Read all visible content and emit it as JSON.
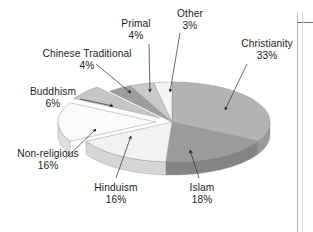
{
  "figure": {
    "name": "world-religions-pie-chart",
    "type": "exploded-3d-pie",
    "background_color": "#ffffff",
    "text_color": "#1c1c1c"
  },
  "chart_data": {
    "type": "pie",
    "title": "",
    "xlabel": "",
    "ylabel": "",
    "legend_position": "callout-labels",
    "grid": false,
    "units": "percent",
    "categories": [
      "Christianity",
      "Islam",
      "Hinduism",
      "Non-religious",
      "Buddhism",
      "Chinese Traditional",
      "Primal",
      "Other"
    ],
    "values": [
      33,
      18,
      16,
      16,
      6,
      4,
      4,
      3
    ],
    "slices": [
      {
        "label": "Christianity",
        "percent": "33%",
        "value": 33,
        "color": "#b3b3b3",
        "side_color": "#9a9a9a",
        "exploded": false
      },
      {
        "label": "Islam",
        "percent": "18%",
        "value": 18,
        "color": "#9b9b9b",
        "side_color": "#848484",
        "exploded": false
      },
      {
        "label": "Hinduism",
        "percent": "16%",
        "value": 16,
        "color": "#f2f2f2",
        "side_color": "#d6d6d6",
        "exploded": false
      },
      {
        "label": "Non-religious",
        "percent": "16%",
        "value": 16,
        "color": "#fafafa",
        "side_color": "#dedede",
        "exploded": true
      },
      {
        "label": "Buddhism",
        "percent": "6%",
        "value": 6,
        "color": "#c6c6c6",
        "side_color": "#ababab",
        "exploded": true
      },
      {
        "label": "Chinese Traditional",
        "percent": "4%",
        "value": 4,
        "color": "#9e9e9e",
        "side_color": "#888888",
        "exploded": false
      },
      {
        "label": "Primal",
        "percent": "4%",
        "value": 4,
        "color": "#c9c9c9",
        "side_color": "#aeaeae",
        "exploded": false
      },
      {
        "label": "Other",
        "percent": "3%",
        "value": 3,
        "color": "#f4f4f4",
        "side_color": "#d8d8d8",
        "exploded": false
      }
    ]
  },
  "labels": {
    "primal": {
      "name": "Primal",
      "pct": "4%"
    },
    "other": {
      "name": "Other",
      "pct": "3%"
    },
    "christianity": {
      "name": "Christianity",
      "pct": "33%"
    },
    "chinese": {
      "name": "Chinese Traditional",
      "pct": "4%"
    },
    "buddhism": {
      "name": "Buddhism",
      "pct": "6%"
    },
    "nonreligious": {
      "name": "Non-religious",
      "pct": "16%"
    },
    "hinduism": {
      "name": "Hinduism",
      "pct": "16%"
    },
    "islam": {
      "name": "Islam",
      "pct": "18%"
    }
  }
}
